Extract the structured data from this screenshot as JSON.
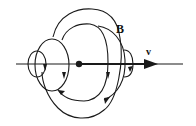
{
  "diagram": {
    "labels": {
      "field": "B",
      "velocity": "v"
    },
    "colors": {
      "stroke": "#1a1a1a",
      "background": "#ffffff"
    },
    "elements": [
      {
        "type": "axis-line",
        "direction": "right"
      },
      {
        "type": "point-charge"
      },
      {
        "type": "field-loop",
        "count": 6
      }
    ]
  }
}
